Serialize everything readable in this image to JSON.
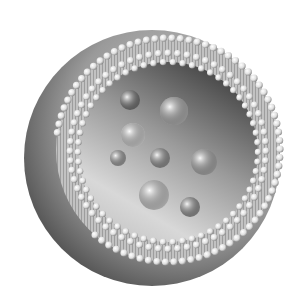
{
  "image": {
    "subject": "liposome cross-section illustration",
    "colors": {
      "background": "#ffffff",
      "shell_dark": "#4a4a4a",
      "shell_mid": "#9a9a9a",
      "bead": "#e6e6e6",
      "bead_shadow": "#7a7a7a",
      "interior_dark": "#3c3c3c",
      "interior_light": "#d8d8d8",
      "vesicle": "#d0d0d0"
    },
    "outer_center": [
      152,
      158
    ],
    "outer_radius": 128,
    "inner_center": [
      168,
      152
    ],
    "inner_radius": 90,
    "vesicles": [
      {
        "cx": 174,
        "cy": 111,
        "r": 14,
        "tone": "#bdbdbd"
      },
      {
        "cx": 133,
        "cy": 135,
        "r": 12,
        "tone": "#e2e2e2"
      },
      {
        "cx": 154,
        "cy": 195,
        "r": 15,
        "tone": "#dcdcdc"
      },
      {
        "cx": 160,
        "cy": 158,
        "r": 10,
        "tone": "#9a9a9a"
      },
      {
        "cx": 204,
        "cy": 162,
        "r": 13,
        "tone": "#b5b5b5"
      },
      {
        "cx": 190,
        "cy": 207,
        "r": 10,
        "tone": "#9c9c9c"
      },
      {
        "cx": 118,
        "cy": 158,
        "r": 8,
        "tone": "#a8a8a8"
      },
      {
        "cx": 130,
        "cy": 100,
        "r": 10,
        "tone": "#7a7a7a"
      }
    ]
  }
}
